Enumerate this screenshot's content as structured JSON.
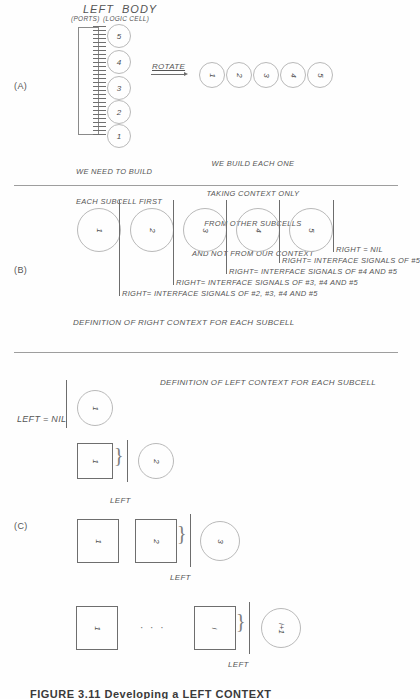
{
  "figure": {
    "bottom_caption": "FIGURE 3.11  Developing a LEFT CONTEXT",
    "sections": {
      "a_label": "(A)",
      "b_label": "(B)",
      "c_label": "(C)"
    }
  },
  "section_a": {
    "title": "LEFT  BODY",
    "subtitle_ports": "(PORTS)",
    "subtitle_logic": "(LOGIC CELL)",
    "rotate_label": "ROTATE",
    "stack_circles": [
      "5",
      "4",
      "3",
      "2",
      "1"
    ],
    "rotated_circles": [
      "1",
      "2",
      "3",
      "4",
      "5"
    ],
    "note_left": [
      "WE NEED TO BUILD",
      "EACH SUBCELL FIRST"
    ],
    "note_right": [
      "WE BUILD EACH ONE",
      "TAKING CONTEXT ONLY",
      "FROM OTHER SUBCELLS",
      "AND NOT FROM OUR CONTEXT"
    ]
  },
  "section_b": {
    "circles": [
      "1",
      "2",
      "3",
      "4",
      "5"
    ],
    "right_labels": [
      "RIGHT = NIL",
      "RIGHT= INTERFACE SIGNALS OF #5",
      "RIGHT= INTERFACE SIGNALS OF #4 AND #5",
      "RIGHT= INTERFACE SIGNALS OF #3, #4 AND #5",
      "RIGHT= INTERFACE SIGNALS OF #2, #3, #4 AND #5"
    ],
    "caption": "DEFINITION OF RIGHT CONTEXT FOR EACH SUBCELL"
  },
  "section_c": {
    "caption": "DEFINITION OF LEFT CONTEXT FOR EACH SUBCELL",
    "row1": {
      "left_label": "LEFT = NIL",
      "circle": "1"
    },
    "row2": {
      "squares": [
        "1"
      ],
      "circle": "2",
      "left_label": "LEFT"
    },
    "row3": {
      "squares": [
        "1",
        "2"
      ],
      "circle": "3",
      "left_label": "LEFT"
    },
    "row4": {
      "squares": [
        "1",
        "i"
      ],
      "ellipsis": "· · ·",
      "circle": "i+1",
      "left_label": "LEFT"
    }
  },
  "colors": {
    "ink": "#4a4a4a",
    "line": "#6d6d6d",
    "faint": "#b9b9b9"
  }
}
